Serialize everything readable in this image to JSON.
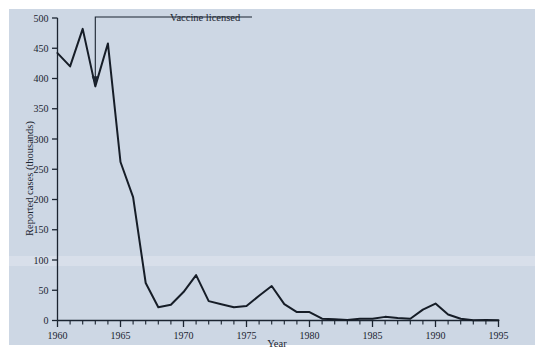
{
  "figure": {
    "background_color": "#cdd7e4",
    "page_margin_color": "#ffffff",
    "line_color": "#161d27"
  },
  "annotation": {
    "label": "Vaccine licensed",
    "year": 1963,
    "value": 387
  },
  "axes": {
    "y_title": "Reported cases (thousands)",
    "x_title": "Year",
    "y_ticks": [
      "0",
      "50",
      "100",
      "150",
      "200",
      "250",
      "300",
      "350",
      "400",
      "450",
      "500"
    ],
    "x_ticks": [
      "1960",
      "1965",
      "1970",
      "1975",
      "1980",
      "1985",
      "1990",
      "1995"
    ]
  },
  "chart_data": {
    "type": "line",
    "title": "",
    "subtitle": "",
    "xlabel": "Year",
    "ylabel": "Reported cases (thousands)",
    "xlim": [
      1960,
      1995
    ],
    "ylim": [
      0,
      500
    ],
    "x_tick_step_major": 5,
    "x_tick_step_minor": 1,
    "y_tick_step": 50,
    "grid": false,
    "legend": null,
    "annotations": [
      {
        "text": "Vaccine licensed",
        "x": 1963,
        "y": 387,
        "arrow": true
      }
    ],
    "x": [
      1960,
      1961,
      1962,
      1963,
      1964,
      1965,
      1966,
      1967,
      1968,
      1969,
      1970,
      1971,
      1972,
      1973,
      1974,
      1975,
      1976,
      1977,
      1978,
      1979,
      1980,
      1981,
      1982,
      1983,
      1984,
      1985,
      1986,
      1987,
      1988,
      1989,
      1990,
      1991,
      1992,
      1993,
      1994,
      1995
    ],
    "series": [
      {
        "name": "Reported measles cases",
        "values": [
          442,
          420,
          482,
          387,
          458,
          262,
          204,
          62,
          22,
          26,
          47,
          75,
          32,
          27,
          22,
          24,
          41,
          57,
          27,
          14,
          14,
          3,
          2,
          1,
          3,
          3,
          6,
          4,
          3,
          18,
          28,
          10,
          3,
          0.3,
          1,
          0.3
        ]
      }
    ]
  }
}
